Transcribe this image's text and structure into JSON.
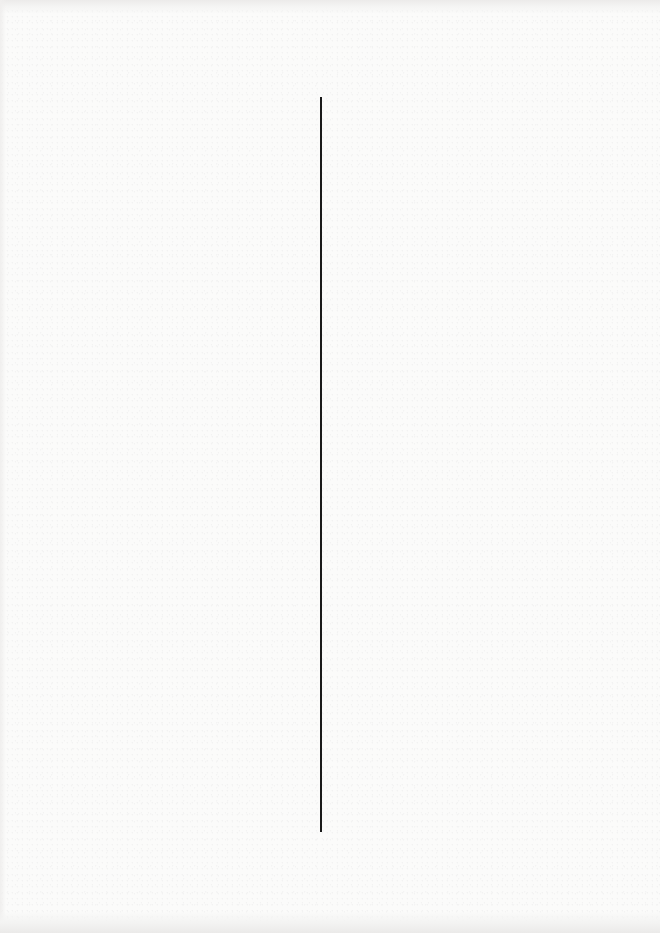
{
  "page": {
    "type": "scanned-blank-page",
    "background_color": "#fbfbfa",
    "text_content": []
  },
  "divider": {
    "orientation": "vertical",
    "color": "#1a1a1a",
    "x": 321,
    "y_start": 97,
    "y_end": 832
  }
}
